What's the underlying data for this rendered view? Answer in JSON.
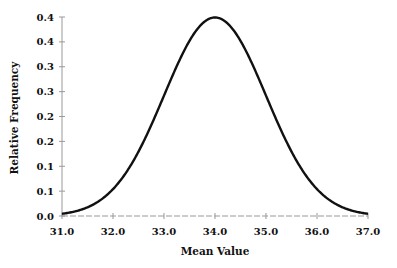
{
  "chart_data": {
    "type": "line",
    "title": "",
    "xlabel": "Mean Value",
    "ylabel": "Relative Frequency",
    "xlim": [
      31.0,
      37.0
    ],
    "ylim": [
      0.0,
      0.4
    ],
    "x_ticks": [
      "31.0",
      "32.0",
      "33.0",
      "34.0",
      "35.0",
      "36.0",
      "37.0"
    ],
    "y_ticks": [
      "0.0",
      "0.1",
      "0.1",
      "0.2",
      "0.2",
      "0.3",
      "0.3",
      "0.4",
      "0.4"
    ],
    "grid": false,
    "legend": null,
    "series": [
      {
        "name": "Normal distribution (mean 34.0, sd 1.0)",
        "x": [
          31.0,
          31.5,
          32.0,
          32.5,
          33.0,
          33.5,
          34.0,
          34.5,
          35.0,
          35.5,
          36.0,
          36.5,
          37.0
        ],
        "values": [
          0.004,
          0.018,
          0.054,
          0.13,
          0.242,
          0.352,
          0.399,
          0.352,
          0.242,
          0.13,
          0.054,
          0.018,
          0.004
        ]
      }
    ],
    "colors": {
      "curve": "#111111",
      "axis": "#999999"
    }
  }
}
